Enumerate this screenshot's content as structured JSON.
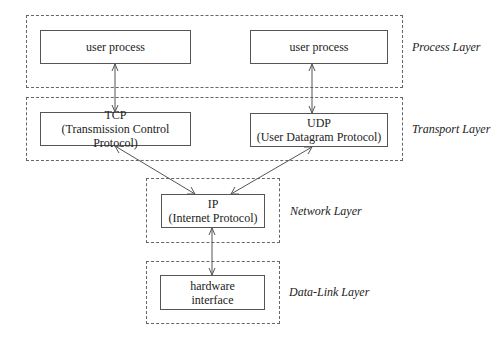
{
  "diagram": {
    "layers": [
      {
        "name": "Process Layer",
        "boxes": [
          {
            "lines": [
              "user process"
            ]
          },
          {
            "lines": [
              "user process"
            ]
          }
        ]
      },
      {
        "name": "Transport Layer",
        "boxes": [
          {
            "lines": [
              "TCP",
              "(Transmission Control Protocol)"
            ]
          },
          {
            "lines": [
              "UDP",
              "(User Datagram Protocol)"
            ]
          }
        ]
      },
      {
        "name": "Network Layer",
        "boxes": [
          {
            "lines": [
              "IP",
              "(Internet Protocol)"
            ]
          }
        ]
      },
      {
        "name": "Data-Link Layer",
        "boxes": [
          {
            "lines": [
              "hardware",
              "interface"
            ]
          }
        ]
      }
    ],
    "edges": [
      {
        "from": "user process (left)",
        "to": "TCP",
        "type": "bidirectional"
      },
      {
        "from": "user process (right)",
        "to": "UDP",
        "type": "bidirectional"
      },
      {
        "from": "TCP",
        "to": "IP",
        "type": "bidirectional"
      },
      {
        "from": "UDP",
        "to": "IP",
        "type": "bidirectional"
      },
      {
        "from": "IP",
        "to": "hardware interface",
        "type": "bidirectional"
      }
    ]
  }
}
